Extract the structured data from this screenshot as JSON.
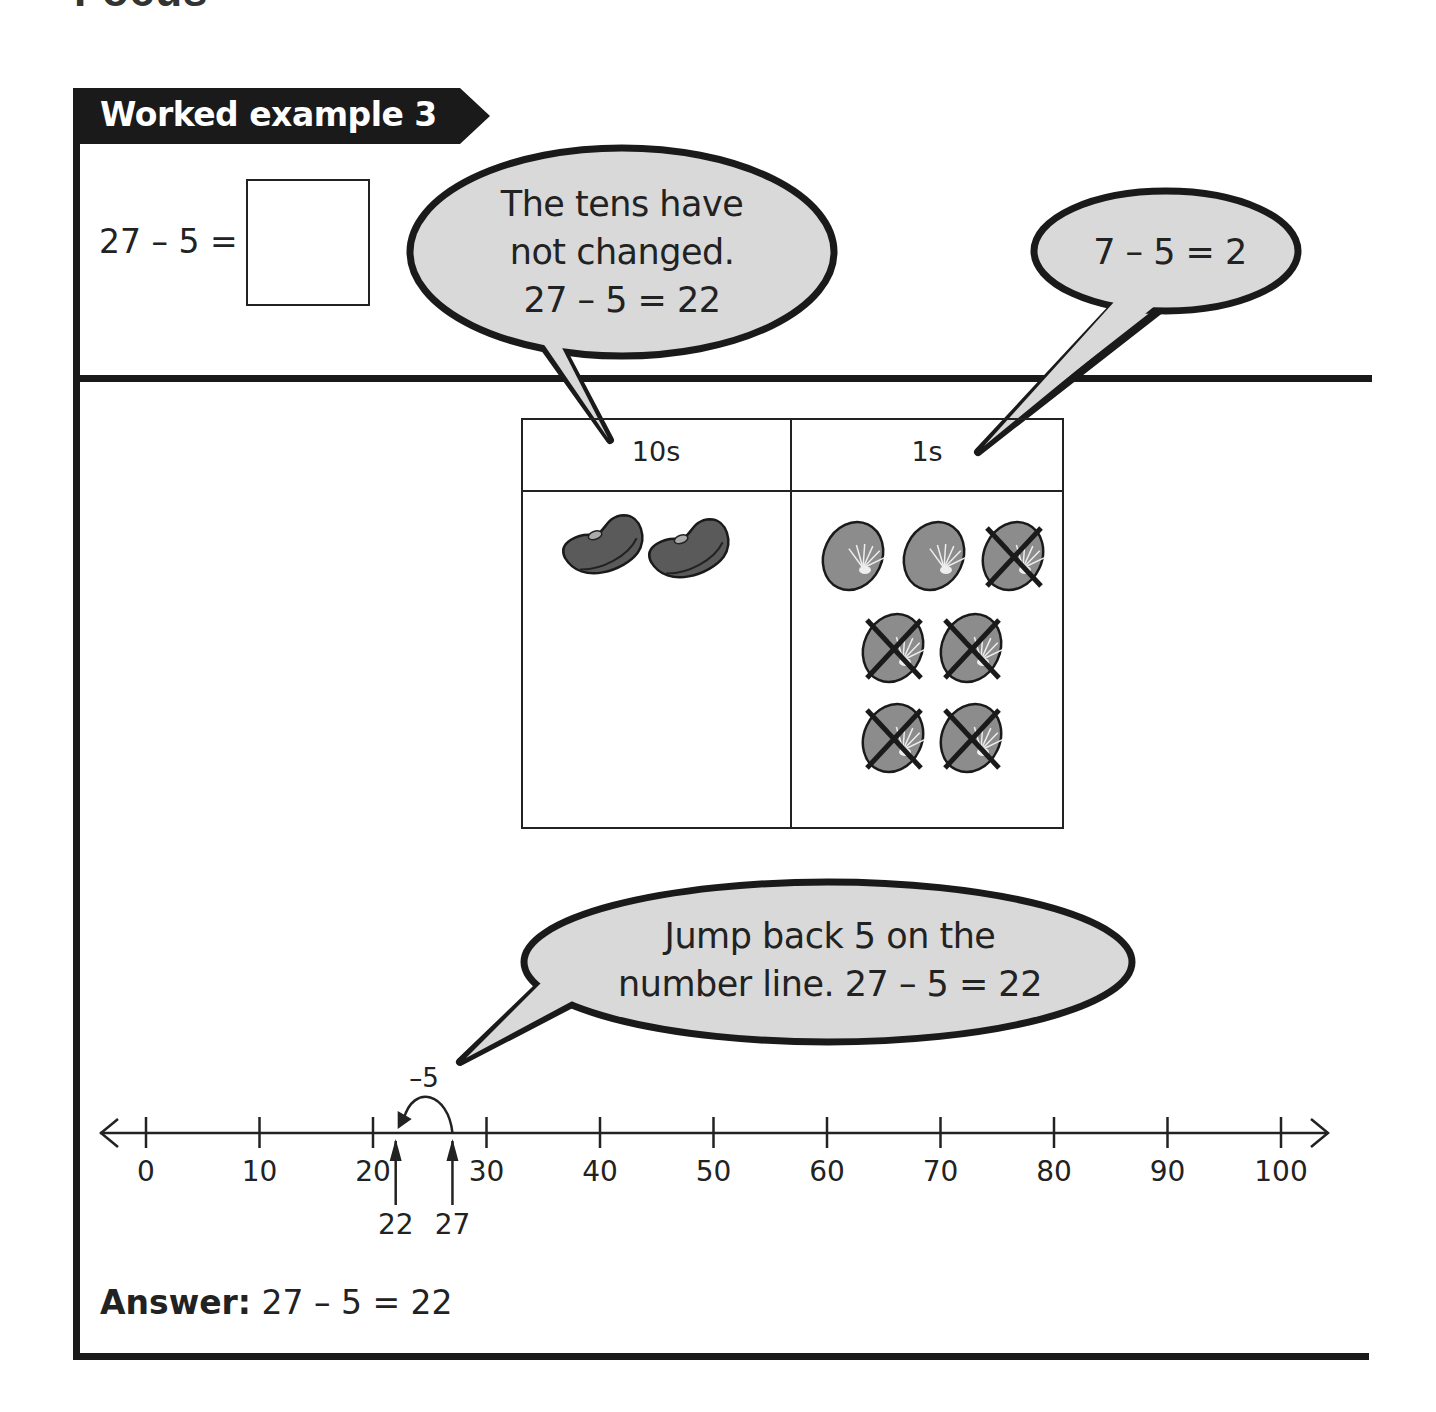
{
  "page": {
    "section_heading": "Focus",
    "tab_title": "Worked example 3"
  },
  "question": {
    "equation": "27 – 5 =",
    "answer_box_value": ""
  },
  "bubbles": {
    "tens": [
      "The tens have",
      "not changed.",
      "27 – 5 = 22"
    ],
    "ones": [
      "7 – 5 = 2"
    ],
    "number_line": [
      "Jump back 5 on the",
      "number line. 27 – 5 = 22"
    ]
  },
  "place_value_table": {
    "columns": [
      {
        "header": "10s",
        "counter": "ten-bean",
        "count": 2,
        "crossed_out": 0
      },
      {
        "header": "1s",
        "counter": "one-bean",
        "count": 7,
        "crossed_out": 5
      }
    ]
  },
  "number_line": {
    "min": 0,
    "max": 100,
    "step": 10,
    "tick_labels": [
      "0",
      "10",
      "20",
      "30",
      "40",
      "50",
      "60",
      "70",
      "80",
      "90",
      "100"
    ],
    "jump": {
      "from": 27,
      "to": 22,
      "label": "–5"
    },
    "markers": [
      {
        "value": 22,
        "label": "22"
      },
      {
        "value": 27,
        "label": "27"
      }
    ]
  },
  "answer": {
    "label": "Answer:",
    "text": "27 – 5 = 22"
  },
  "colors": {
    "ink": "#1a1a1a",
    "bubble_fill": "#d9d9d9",
    "ten_bean": "#5a5a5a",
    "one_bean": "#8c8c8c"
  }
}
